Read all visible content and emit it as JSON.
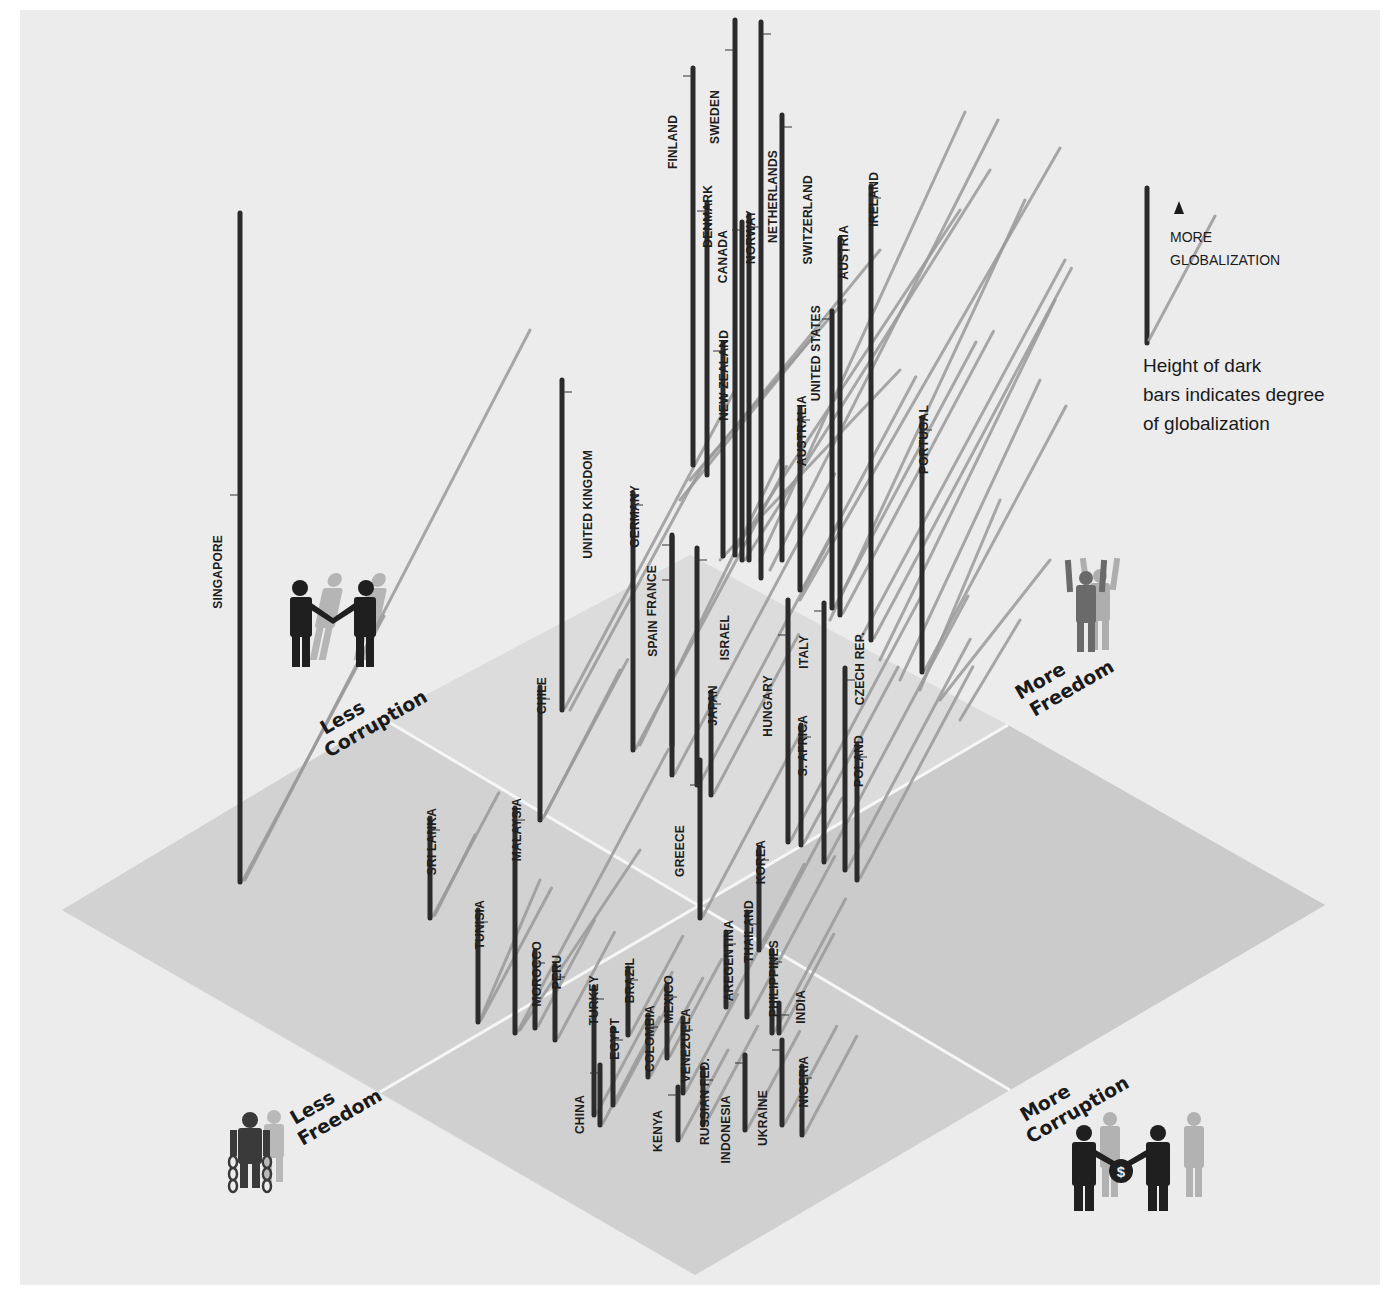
{
  "chart_data": {
    "type": "3d-isometric-bar",
    "title": "",
    "axes": {
      "corruption_axis": {
        "low_label": "Less Corruption",
        "high_label": "More Corruption"
      },
      "freedom_axis": {
        "low_label": "Less Freedom",
        "high_label": "More Freedom"
      },
      "vertical": "Degree of globalization (bar height)"
    },
    "legend": {
      "arrow_label_line1": "MORE",
      "arrow_label_line2": "GLOBALIZATION",
      "note_line1": "Height of dark",
      "note_line2": "bars indicates degree",
      "note_line3": "of globalization"
    },
    "colors": {
      "background": "#ececec",
      "plane_light": "#d6d6d6",
      "plane_dark": "#c9c9c9",
      "bar": "#2b2b2b",
      "shadow": "#9a9a9a",
      "grid_line": "#f4f4f4"
    },
    "bars": [
      {
        "country": "SINGAPORE",
        "x": 240,
        "top": 213,
        "bottom": 882,
        "label_x": 222,
        "label_y": 535,
        "label_side": "left",
        "shadow_len": 300
      },
      {
        "country": "FINLAND",
        "x": 693,
        "top": 68,
        "bottom": 465,
        "label_x": 677,
        "label_y": 115,
        "label_side": "left",
        "shadow_len": 0
      },
      {
        "country": "SWEDEN",
        "x": 735,
        "top": 20,
        "bottom": 555,
        "label_x": 719,
        "label_y": 90,
        "label_side": "left",
        "shadow_len": 0
      },
      {
        "country": "NETHERLANDS",
        "x": 761,
        "top": 22,
        "bottom": 578,
        "label_x": 777,
        "label_y": 150,
        "label_side": "right",
        "shadow_len": 0
      },
      {
        "country": "SWITZERLAND",
        "x": 782,
        "top": 115,
        "bottom": 560,
        "label_x": 812,
        "label_y": 175,
        "label_side": "right",
        "shadow_len": 0
      },
      {
        "country": "DENMARK",
        "x": 707,
        "top": 203,
        "bottom": 475,
        "label_x": 712,
        "label_y": 185,
        "label_side": "left",
        "shadow_len": 0
      },
      {
        "country": "CANADA",
        "x": 742,
        "top": 222,
        "bottom": 560,
        "label_x": 727,
        "label_y": 230,
        "label_side": "left",
        "shadow_len": 0
      },
      {
        "country": "NORWAY",
        "x": 749,
        "top": 215,
        "bottom": 560,
        "label_x": 755,
        "label_y": 210,
        "label_side": "right",
        "shadow_len": 0
      },
      {
        "country": "NEW ZEALAND",
        "x": 723,
        "top": 343,
        "bottom": 556,
        "label_x": 728,
        "label_y": 330,
        "label_side": "left",
        "shadow_len": 0
      },
      {
        "country": "UNITED STATES",
        "x": 832,
        "top": 311,
        "bottom": 608,
        "label_x": 820,
        "label_y": 305,
        "label_side": "left",
        "shadow_len": 300
      },
      {
        "country": "AUSTRIA",
        "x": 840,
        "top": 238,
        "bottom": 615,
        "label_x": 848,
        "label_y": 225,
        "label_side": "right",
        "shadow_len": 320
      },
      {
        "country": "IRELAND",
        "x": 871,
        "top": 186,
        "bottom": 640,
        "label_x": 878,
        "label_y": 172,
        "label_side": "right",
        "shadow_len": 420
      },
      {
        "country": "AUSTRALIA",
        "x": 800,
        "top": 408,
        "bottom": 590,
        "label_x": 806,
        "label_y": 395,
        "label_side": "right",
        "shadow_len": 240
      },
      {
        "country": "PORTUGAL",
        "x": 922,
        "top": 418,
        "bottom": 672,
        "label_x": 928,
        "label_y": 405,
        "label_side": "right",
        "shadow_len": 300
      },
      {
        "country": "UNITED KINGDOM",
        "x": 562,
        "top": 380,
        "bottom": 710,
        "label_x": 592,
        "label_y": 450,
        "label_side": "right",
        "shadow_len": 360
      },
      {
        "country": "GERMANY",
        "x": 633,
        "top": 493,
        "bottom": 750,
        "label_x": 639,
        "label_y": 485,
        "label_side": "right",
        "shadow_len": 320
      },
      {
        "country": "FRANCE",
        "x": 672,
        "top": 537,
        "bottom": 775,
        "label_x": 656,
        "label_y": 565,
        "label_side": "left",
        "shadow_len": 340
      },
      {
        "country": "SPAIN",
        "x": 672,
        "top": 535,
        "bottom": 745,
        "label_x": 657,
        "label_y": 620,
        "label_side": "left",
        "shadow_len": 0
      },
      {
        "country": "ISRAEL",
        "x": 697,
        "top": 548,
        "bottom": 785,
        "label_x": 729,
        "label_y": 615,
        "label_side": "right",
        "shadow_len": 300
      },
      {
        "country": "JAPAN",
        "x": 711,
        "top": 692,
        "bottom": 795,
        "label_x": 717,
        "label_y": 685,
        "label_side": "right",
        "shadow_len": 180
      },
      {
        "country": "HUNGARY",
        "x": 788,
        "top": 600,
        "bottom": 842,
        "label_x": 772,
        "label_y": 675,
        "label_side": "left",
        "shadow_len": 280
      },
      {
        "country": "ITALY",
        "x": 824,
        "top": 603,
        "bottom": 862,
        "label_x": 808,
        "label_y": 635,
        "label_side": "left",
        "shadow_len": 300
      },
      {
        "country": "S. AFRICA",
        "x": 801,
        "top": 725,
        "bottom": 845,
        "label_x": 807,
        "label_y": 715,
        "label_side": "right",
        "shadow_len": 200
      },
      {
        "country": "CZECH REP.",
        "x": 845,
        "top": 668,
        "bottom": 870,
        "label_x": 864,
        "label_y": 632,
        "label_side": "right",
        "shadow_len": 260
      },
      {
        "country": "POLAND",
        "x": 857,
        "top": 745,
        "bottom": 880,
        "label_x": 863,
        "label_y": 735,
        "label_side": "right",
        "shadow_len": 240
      },
      {
        "country": "GREECE",
        "x": 700,
        "top": 760,
        "bottom": 918,
        "label_x": 684,
        "label_y": 825,
        "label_side": "left",
        "shadow_len": 220
      },
      {
        "country": "CHILE",
        "x": 540,
        "top": 687,
        "bottom": 820,
        "label_x": 546,
        "label_y": 677,
        "label_side": "right",
        "shadow_len": 180
      },
      {
        "country": "SRI LANKA",
        "x": 430,
        "top": 818,
        "bottom": 918,
        "label_x": 436,
        "label_y": 808,
        "label_side": "right",
        "shadow_len": 140
      },
      {
        "country": "MALAYSIA",
        "x": 515,
        "top": 808,
        "bottom": 1033,
        "label_x": 521,
        "label_y": 798,
        "label_side": "right",
        "shadow_len": 320
      },
      {
        "country": "TUNISIA",
        "x": 478,
        "top": 910,
        "bottom": 1022,
        "label_x": 484,
        "label_y": 900,
        "label_side": "right",
        "shadow_len": 150
      },
      {
        "country": "MOROCCO",
        "x": 535,
        "top": 951,
        "bottom": 1028,
        "label_x": 541,
        "label_y": 941,
        "label_side": "right",
        "shadow_len": 120
      },
      {
        "country": "PERU",
        "x": 555,
        "top": 965,
        "bottom": 1040,
        "label_x": 561,
        "label_y": 955,
        "label_side": "right",
        "shadow_len": 120
      },
      {
        "country": "KOREA",
        "x": 759,
        "top": 848,
        "bottom": 950,
        "label_x": 765,
        "label_y": 840,
        "label_side": "right",
        "shadow_len": 170
      },
      {
        "country": "THAILAND",
        "x": 747,
        "top": 912,
        "bottom": 1017,
        "label_x": 753,
        "label_y": 900,
        "label_side": "right",
        "shadow_len": 180
      },
      {
        "country": "AREGENTINA",
        "x": 726,
        "top": 932,
        "bottom": 1007,
        "label_x": 733,
        "label_y": 920,
        "label_side": "right",
        "shadow_len": 160
      },
      {
        "country": "PHILIPPINES",
        "x": 772,
        "top": 950,
        "bottom": 1033,
        "label_x": 778,
        "label_y": 940,
        "label_side": "right",
        "shadow_len": 150
      },
      {
        "country": "INDIA",
        "x": 779,
        "top": 1003,
        "bottom": 1033,
        "label_x": 805,
        "label_y": 990,
        "label_side": "right",
        "shadow_len": 110
      },
      {
        "country": "TURKEY",
        "x": 594,
        "top": 987,
        "bottom": 1115,
        "label_x": 598,
        "label_y": 975,
        "label_side": "right",
        "shadow_len": 160
      },
      {
        "country": "CHINA",
        "x": 600,
        "top": 1065,
        "bottom": 1125,
        "label_x": 584,
        "label_y": 1095,
        "label_side": "left",
        "shadow_len": 120
      },
      {
        "country": "EGYPT",
        "x": 613,
        "top": 1028,
        "bottom": 1105,
        "label_x": 619,
        "label_y": 1018,
        "label_side": "right",
        "shadow_len": 120
      },
      {
        "country": "BRAZIL",
        "x": 628,
        "top": 968,
        "bottom": 1035,
        "label_x": 634,
        "label_y": 958,
        "label_side": "right",
        "shadow_len": 110
      },
      {
        "country": "COLOMBIA",
        "x": 648,
        "top": 1015,
        "bottom": 1077,
        "label_x": 654,
        "label_y": 1005,
        "label_side": "right",
        "shadow_len": 110
      },
      {
        "country": "MEXICO",
        "x": 667,
        "top": 985,
        "bottom": 1058,
        "label_x": 673,
        "label_y": 975,
        "label_side": "right",
        "shadow_len": 110
      },
      {
        "country": "VENEZUELA",
        "x": 683,
        "top": 1018,
        "bottom": 1093,
        "label_x": 690,
        "label_y": 1008,
        "label_side": "right",
        "shadow_len": 110
      },
      {
        "country": "KENYA",
        "x": 678,
        "top": 1087,
        "bottom": 1140,
        "label_x": 662,
        "label_y": 1110,
        "label_side": "left",
        "shadow_len": 100
      },
      {
        "country": "RUSSIAN FED.",
        "x": 703,
        "top": 1068,
        "bottom": 1125,
        "label_x": 709,
        "label_y": 1058,
        "label_side": "right",
        "shadow_len": 110
      },
      {
        "country": "INDONESIA",
        "x": 745,
        "top": 1055,
        "bottom": 1130,
        "label_x": 730,
        "label_y": 1095,
        "label_side": "left",
        "shadow_len": 110
      },
      {
        "country": "UKRAINE",
        "x": 782,
        "top": 1040,
        "bottom": 1125,
        "label_x": 767,
        "label_y": 1090,
        "label_side": "left",
        "shadow_len": 110
      },
      {
        "country": "NIGERIA",
        "x": 802,
        "top": 1066,
        "bottom": 1135,
        "label_x": 808,
        "label_y": 1056,
        "label_side": "right",
        "shadow_len": 110
      }
    ],
    "decor_shadow_lines": [
      [
        760,
        560,
        965,
        112
      ],
      [
        770,
        570,
        998,
        120
      ],
      [
        800,
        600,
        1060,
        148
      ],
      [
        830,
        620,
        1025,
        200
      ],
      [
        860,
        640,
        1065,
        260
      ],
      [
        880,
        660,
        1055,
        300
      ],
      [
        900,
        680,
        1040,
        380
      ],
      [
        920,
        690,
        1000,
        500
      ],
      [
        940,
        700,
        1050,
        560
      ],
      [
        960,
        720,
        1020,
        620
      ],
      [
        745,
        560,
        990,
        170
      ],
      [
        735,
        550,
        960,
        210
      ],
      [
        700,
        470,
        880,
        250
      ],
      [
        690,
        480,
        845,
        300
      ],
      [
        680,
        500,
        810,
        340
      ],
      [
        720,
        560,
        900,
        370
      ],
      [
        640,
        745,
        780,
        460
      ],
      [
        570,
        710,
        700,
        470
      ],
      [
        545,
        815,
        620,
        670
      ],
      [
        520,
        1030,
        640,
        850
      ],
      [
        480,
        1020,
        540,
        880
      ],
      [
        435,
        915,
        475,
        835
      ],
      [
        245,
        880,
        530,
        330
      ]
    ]
  },
  "quadrants": {
    "less_corruption": {
      "line1": "Less",
      "line2": "Corruption"
    },
    "more_freedom": {
      "line1": "More",
      "line2": "Freedom"
    },
    "less_freedom": {
      "line1": "Less",
      "line2": "Freedom"
    },
    "more_corruption": {
      "line1": "More",
      "line2": "Corruption"
    },
    "icons": {
      "less_corruption": "handshake-icon",
      "more_freedom": "raised-arms-person-icon",
      "less_freedom": "chained-person-icon",
      "more_corruption": "bribe-handshake-icon",
      "bribe_symbol": "$"
    }
  }
}
